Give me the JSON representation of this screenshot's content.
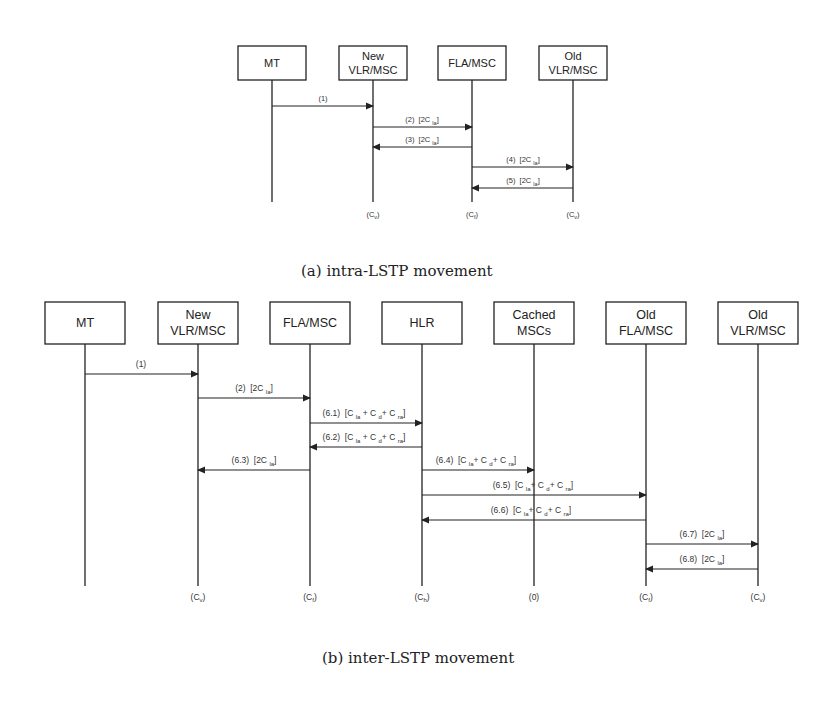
{
  "diagram_a": {
    "caption": "(a) intra-LSTP movement",
    "entities": [
      {
        "id": "MT",
        "lines": [
          "MT"
        ],
        "cost": ""
      },
      {
        "id": "NewVLR",
        "lines": [
          "New",
          "VLR/MSC"
        ],
        "cost": "(Cv)"
      },
      {
        "id": "FLA",
        "lines": [
          "FLA/MSC"
        ],
        "cost": "(Cf)"
      },
      {
        "id": "OldVLR",
        "lines": [
          "Old",
          "VLR/MSC"
        ],
        "cost": "(Cv)"
      }
    ],
    "messages": [
      {
        "label": "(1)",
        "from": "MT",
        "to": "NewVLR"
      },
      {
        "label": "(2) [2C_la]",
        "from": "NewVLR",
        "to": "FLA"
      },
      {
        "label": "(3) [2C_la]",
        "from": "FLA",
        "to": "NewVLR"
      },
      {
        "label": "(4) [2C_la]",
        "from": "FLA",
        "to": "OldVLR"
      },
      {
        "label": "(5) [2C_la]",
        "from": "OldVLR",
        "to": "FLA"
      }
    ]
  },
  "diagram_b": {
    "caption": "(b) inter-LSTP movement",
    "entities": [
      {
        "id": "MT",
        "lines": [
          "MT"
        ],
        "cost": ""
      },
      {
        "id": "NewVLR",
        "lines": [
          "New",
          "VLR/MSC"
        ],
        "cost": "(Cv)"
      },
      {
        "id": "FLA",
        "lines": [
          "FLA/MSC"
        ],
        "cost": "(Cf)"
      },
      {
        "id": "HLR",
        "lines": [
          "HLR"
        ],
        "cost": "(Ch)"
      },
      {
        "id": "Cached",
        "lines": [
          "Cached",
          "MSCs"
        ],
        "cost": "(0)"
      },
      {
        "id": "OldFLA",
        "lines": [
          "Old",
          "FLA/MSC"
        ],
        "cost": "(Cf)"
      },
      {
        "id": "OldVLR",
        "lines": [
          "Old",
          "VLR/MSC"
        ],
        "cost": "(Cv)"
      }
    ],
    "messages": [
      {
        "label": "(1)",
        "from": "MT",
        "to": "NewVLR"
      },
      {
        "label": "(2) [2C_la]",
        "from": "NewVLR",
        "to": "FLA"
      },
      {
        "label": "(6.1) [C_la + C_d + C_ra]",
        "from": "FLA",
        "to": "HLR"
      },
      {
        "label": "(6.2) [C_la + C_d + C_ra]",
        "from": "HLR",
        "to": "FLA"
      },
      {
        "label": "(6.3) [2C_la]",
        "from": "FLA",
        "to": "NewVLR"
      },
      {
        "label": "(6.4) [C_la + C_d + C_ra]",
        "from": "HLR",
        "to": "Cached"
      },
      {
        "label": "(6.5) [C_la + C_d + C_ra]",
        "from": "HLR",
        "to": "OldFLA"
      },
      {
        "label": "(6.6) [C_la + C_d + C_ra]",
        "from": "OldFLA",
        "to": "HLR"
      },
      {
        "label": "(6.7) [2C_la]",
        "from": "OldFLA",
        "to": "OldVLR"
      },
      {
        "label": "(6.8) [2C_la]",
        "from": "OldVLR",
        "to": "OldFLA"
      }
    ]
  }
}
